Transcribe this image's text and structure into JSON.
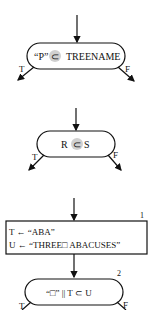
{
  "diagram": {
    "decision1": {
      "left": "“P”",
      "op": "⊂",
      "right": "TREENAME",
      "true_label": "T",
      "false_label": "F"
    },
    "decision2": {
      "left": "R",
      "op": "⊂",
      "right": "S",
      "true_label": "T",
      "false_label": "F"
    },
    "process1": {
      "number": "1",
      "line1": "T ← “ABA”",
      "line2": "U ← “THREE□ ABACUSES”"
    },
    "decision3": {
      "number": "2",
      "text": "“□” || T ⊂ U",
      "true_label": "T",
      "false_label": "F"
    },
    "highlight_color": "#d0d0d0"
  }
}
